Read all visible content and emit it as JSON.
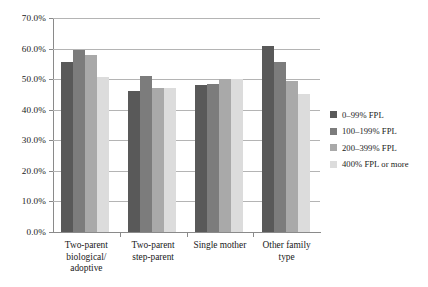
{
  "chart_data": {
    "type": "bar",
    "title": "",
    "subtitle": "",
    "xlabel": "",
    "ylabel": "",
    "ylim": [
      0,
      70
    ],
    "ytick_labels": [
      "0.0%",
      "10.0%",
      "20.0%",
      "30.0%",
      "40.0%",
      "50.0%",
      "60.0%",
      "70.0%"
    ],
    "ytick_values": [
      0,
      10,
      20,
      30,
      40,
      50,
      60,
      70
    ],
    "grid": "horizontal",
    "legend_position": "right",
    "categories": [
      "Two-parent biological/ adoptive",
      "Two-parent step-parent",
      "Single mother",
      "Other family type"
    ],
    "category_lines": [
      [
        "Two-parent",
        "biological/",
        "adoptive"
      ],
      [
        "Two-parent",
        "step-parent"
      ],
      [
        "Single mother"
      ],
      [
        "Other family",
        "type"
      ]
    ],
    "series": [
      {
        "name": "0–99% FPL",
        "color": "#595959",
        "values": [
          55.5,
          46.0,
          48.0,
          61.0
        ]
      },
      {
        "name": "100–199% FPL",
        "color": "#7c7c7c",
        "values": [
          59.5,
          51.0,
          48.5,
          55.5
        ]
      },
      {
        "name": "200–399% FPL",
        "color": "#a9a9a9",
        "values": [
          58.0,
          47.0,
          50.0,
          49.5
        ]
      },
      {
        "name": "400% FPL or more",
        "color": "#dcdcdc",
        "values": [
          50.8,
          47.0,
          50.0,
          45.0
        ]
      }
    ]
  },
  "axis": {
    "tick_color": "#8a8a8a",
    "grid_color": "#b4b4b4"
  }
}
